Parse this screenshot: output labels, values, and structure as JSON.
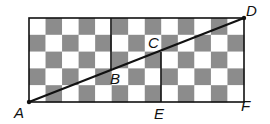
{
  "figure": {
    "grid": {
      "rows": 5,
      "cols": 13,
      "x0": 29,
      "y0": 18,
      "x1": 244,
      "y1": 102,
      "dark_color": "#8c8c8c",
      "light_color": "#ffffff",
      "first_cell": "light"
    },
    "line_color": "#111111",
    "points": {
      "A": {
        "label": "A",
        "x": 29,
        "y": 102
      },
      "B": {
        "label": "B",
        "x": 111,
        "y": 69
      },
      "C": {
        "label": "C",
        "x": 161,
        "y": 52
      },
      "D": {
        "label": "D",
        "x": 244,
        "y": 18
      },
      "E": {
        "label": "E",
        "x": 161,
        "y": 102
      },
      "F": {
        "label": "F",
        "x": 244,
        "y": 102
      }
    },
    "labels": {
      "A": "A",
      "B": "B",
      "C": "C",
      "D": "D",
      "E": "E",
      "F": "F"
    }
  }
}
